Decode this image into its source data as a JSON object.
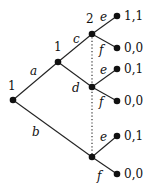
{
  "diagram": {
    "type": "extensive-form game tree",
    "nodes": {
      "root": {
        "x": 13,
        "y": 100,
        "player": "1"
      },
      "n1": {
        "x": 58,
        "y": 62,
        "player": "1"
      },
      "nc": {
        "x": 92,
        "y": 34,
        "player": "2"
      },
      "nd": {
        "x": 92,
        "y": 87
      },
      "nb": {
        "x": 92,
        "y": 157
      }
    },
    "player_labels": {
      "root": "1",
      "n1": "1",
      "nc": "2"
    },
    "actions": {
      "a": "a",
      "b": "b",
      "c": "c",
      "d": "d",
      "e1": "e",
      "f1": "f",
      "e2": "e",
      "f2": "f",
      "e3": "e",
      "f3": "f"
    },
    "payoffs": [
      {
        "x": 117,
        "y": 16,
        "label": "1,1"
      },
      {
        "x": 117,
        "y": 48,
        "label": "0,0"
      },
      {
        "x": 117,
        "y": 69,
        "label": "0,1"
      },
      {
        "x": 117,
        "y": 101,
        "label": "0,0"
      },
      {
        "x": 117,
        "y": 136,
        "label": "0,1"
      },
      {
        "x": 117,
        "y": 174,
        "label": "0,0"
      }
    ],
    "information_set": "dotted line connecting player 2 nodes"
  }
}
